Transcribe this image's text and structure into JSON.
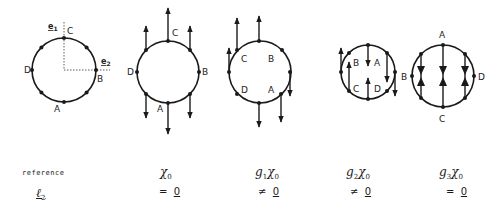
{
  "figure": {
    "diagrams": [
      {
        "id": "reference",
        "labels": {
          "C": "C",
          "B": "B",
          "A": "A",
          "D": "D"
        },
        "axes": {
          "e1": "e1",
          "e2": "e2"
        }
      },
      {
        "id": "chi0",
        "labels": {
          "C": "C",
          "B": "B",
          "A": "A",
          "D": "D"
        }
      },
      {
        "id": "g1chi0",
        "labels": {
          "C": "C",
          "B": "B",
          "A": "A",
          "D": "D"
        }
      },
      {
        "id": "g2chi0",
        "labels": {
          "B": "B",
          "A": "A",
          "C": "C",
          "D": "D"
        }
      },
      {
        "id": "g3chi0",
        "labels": {
          "A": "A",
          "B": "B",
          "D": "D",
          "C": "C"
        }
      }
    ]
  },
  "table": {
    "header_row": {
      "label": "reference",
      "columns": [
        {
          "base": "χ",
          "prefix": "",
          "prefix_sub": "",
          "sub": "0"
        },
        {
          "base": "χ",
          "prefix": "g",
          "prefix_sub": "1",
          "sub": "0"
        },
        {
          "base": "χ",
          "prefix": "g",
          "prefix_sub": "2",
          "sub": "0"
        },
        {
          "base": "χ",
          "prefix": "g",
          "prefix_sub": "3",
          "sub": "0"
        }
      ]
    },
    "value_row": {
      "label_base": "ℓ",
      "label_sub": "2",
      "values": [
        {
          "op": "=",
          "rhs": "0"
        },
        {
          "op": "≠",
          "rhs": "0"
        },
        {
          "op": "≠",
          "rhs": "0"
        },
        {
          "op": "=",
          "rhs": "0"
        }
      ]
    }
  }
}
